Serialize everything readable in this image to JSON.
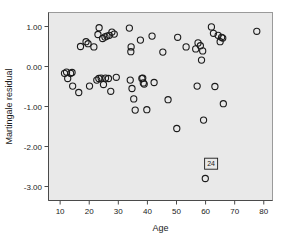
{
  "chart_data": {
    "type": "scatter",
    "title": "",
    "xlabel": "Age",
    "ylabel": "Martingale residual",
    "xlim": [
      6,
      83
    ],
    "ylim": [
      -3.35,
      1.35
    ],
    "xticks": [
      10,
      20,
      30,
      40,
      50,
      60,
      70,
      80
    ],
    "xtick_labels": [
      "10",
      "20",
      "30",
      "40",
      "50",
      "60",
      "70",
      "80"
    ],
    "yticks": [
      1.0,
      0.0,
      -1.0,
      -2.0,
      -3.0
    ],
    "ytick_labels": [
      "1.00",
      "0.00",
      "-1.00",
      "-2.00",
      "-3.00"
    ],
    "grid": false,
    "legend": "none",
    "marker": "open-circle",
    "marker_radius": 3.1,
    "plot_background": "#e9e9e9",
    "marker_color": "#1b1b1b",
    "points": [
      {
        "x": 11.5,
        "y": -0.17
      },
      {
        "x": 12.2,
        "y": -0.14
      },
      {
        "x": 12.6,
        "y": -0.3
      },
      {
        "x": 13.6,
        "y": -0.17
      },
      {
        "x": 14.1,
        "y": -0.15
      },
      {
        "x": 14.3,
        "y": -0.49
      },
      {
        "x": 16.4,
        "y": -0.65
      },
      {
        "x": 17.0,
        "y": 0.5
      },
      {
        "x": 18.9,
        "y": 0.62
      },
      {
        "x": 19.6,
        "y": 0.57
      },
      {
        "x": 20.1,
        "y": -0.49
      },
      {
        "x": 21.6,
        "y": 0.49
      },
      {
        "x": 22.6,
        "y": -0.34
      },
      {
        "x": 23.0,
        "y": 0.8
      },
      {
        "x": 23.3,
        "y": -0.3
      },
      {
        "x": 23.4,
        "y": 0.97
      },
      {
        "x": 24.1,
        "y": -0.29
      },
      {
        "x": 24.6,
        "y": 0.7
      },
      {
        "x": 24.9,
        "y": -0.45
      },
      {
        "x": 25.4,
        "y": 0.74
      },
      {
        "x": 25.6,
        "y": -0.29
      },
      {
        "x": 26.1,
        "y": 0.76
      },
      {
        "x": 26.6,
        "y": -0.3
      },
      {
        "x": 26.9,
        "y": 0.78
      },
      {
        "x": 27.4,
        "y": -0.62
      },
      {
        "x": 27.8,
        "y": 0.86
      },
      {
        "x": 28.6,
        "y": 0.81
      },
      {
        "x": 29.3,
        "y": -0.27
      },
      {
        "x": 33.8,
        "y": 0.96
      },
      {
        "x": 34.1,
        "y": -0.34
      },
      {
        "x": 34.3,
        "y": 0.37
      },
      {
        "x": 34.4,
        "y": 0.49
      },
      {
        "x": 34.7,
        "y": -0.55
      },
      {
        "x": 35.3,
        "y": -0.81
      },
      {
        "x": 35.8,
        "y": -1.09
      },
      {
        "x": 37.6,
        "y": 0.66
      },
      {
        "x": 38.1,
        "y": -0.3
      },
      {
        "x": 38.4,
        "y": -0.29
      },
      {
        "x": 38.6,
        "y": -0.41
      },
      {
        "x": 38.9,
        "y": -0.44
      },
      {
        "x": 39.8,
        "y": -1.08
      },
      {
        "x": 41.6,
        "y": 0.76
      },
      {
        "x": 42.3,
        "y": -0.4
      },
      {
        "x": 45.3,
        "y": 0.36
      },
      {
        "x": 47.1,
        "y": -0.83
      },
      {
        "x": 50.1,
        "y": -1.55
      },
      {
        "x": 50.4,
        "y": 0.73
      },
      {
        "x": 53.3,
        "y": 0.49
      },
      {
        "x": 56.6,
        "y": 0.44
      },
      {
        "x": 57.1,
        "y": -0.49
      },
      {
        "x": 57.4,
        "y": 0.59
      },
      {
        "x": 58.2,
        "y": 0.52
      },
      {
        "x": 58.6,
        "y": 0.16
      },
      {
        "x": 59.0,
        "y": 0.39
      },
      {
        "x": 59.3,
        "y": -1.34
      },
      {
        "x": 59.9,
        "y": -2.8
      },
      {
        "x": 62.0,
        "y": 0.99
      },
      {
        "x": 62.7,
        "y": 0.83
      },
      {
        "x": 63.2,
        "y": -0.5
      },
      {
        "x": 64.3,
        "y": 0.78
      },
      {
        "x": 65.0,
        "y": 0.62
      },
      {
        "x": 65.5,
        "y": 0.73
      },
      {
        "x": 65.9,
        "y": 0.71
      },
      {
        "x": 66.1,
        "y": -0.93
      },
      {
        "x": 77.6,
        "y": 0.88
      }
    ],
    "annotations": [
      {
        "label": "24",
        "point_x": 59.9,
        "point_y": -2.8,
        "box_x": 61.9,
        "box_y": -2.43
      }
    ]
  }
}
